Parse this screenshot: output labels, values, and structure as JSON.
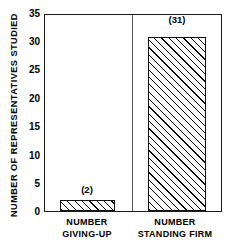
{
  "chart_data": {
    "type": "bar",
    "title": "",
    "xlabel": "",
    "ylabel": "NUMBER OF  REPRESENTATIVES  STUDIED",
    "ylim": [
      0,
      35
    ],
    "yticks": [
      0,
      5,
      10,
      15,
      20,
      25,
      30,
      35
    ],
    "ytick_labels": [
      "0",
      "5",
      "10",
      "15",
      "20",
      "25",
      "30",
      "35"
    ],
    "grid": false,
    "legend": null,
    "categories": [
      "NUMBER GIVING-UP",
      "NUMBER STANDING FIRM"
    ],
    "values": [
      2,
      31
    ],
    "data_labels": [
      "(2)",
      "(31)"
    ],
    "bar_style": {
      "fill": "#ffffff",
      "hatch": "forward-diagonal",
      "edge_color": "#111111"
    },
    "annotations": {
      "group_divider": true
    }
  },
  "axis": {
    "y_title": "NUMBER OF  REPRESENTATIVES  STUDIED",
    "ticks": [
      {
        "label": "35",
        "value": 35
      },
      {
        "label": "30",
        "value": 30
      },
      {
        "label": "25",
        "value": 25
      },
      {
        "label": "20",
        "value": 20
      },
      {
        "label": "15",
        "value": 15
      },
      {
        "label": "10",
        "value": 10
      },
      {
        "label": "5",
        "value": 5
      },
      {
        "label": "0",
        "value": 0
      }
    ]
  },
  "bars": [
    {
      "id": "giving-up",
      "value": 2,
      "data_label": "(2)",
      "category_line1": "NUMBER",
      "category_line2": "GIVING-UP"
    },
    {
      "id": "standing-firm",
      "value": 31,
      "data_label": "(31)",
      "category_line1": "NUMBER",
      "category_line2": "STANDING FIRM"
    }
  ]
}
